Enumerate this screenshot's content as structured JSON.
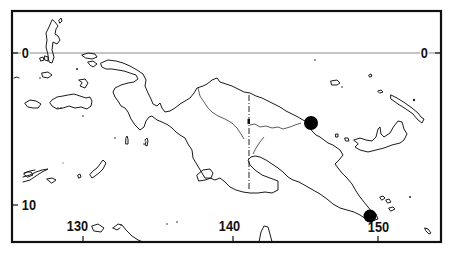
{
  "map": {
    "title": "",
    "frame": {
      "x": 12,
      "y": 11,
      "width": 429,
      "height": 231
    },
    "graticule": {
      "latitude_labels": [
        {
          "text": "0",
          "side": "left",
          "x": 22,
          "y": 46
        },
        {
          "text": "0",
          "side": "right",
          "x": 421,
          "y": 46
        },
        {
          "text": "10",
          "side": "left",
          "x": 20,
          "y": 198
        }
      ],
      "longitude_labels": [
        {
          "text": "130",
          "x": 67,
          "y": 219
        },
        {
          "text": "140",
          "x": 218,
          "y": 219
        },
        {
          "text": "150",
          "x": 365,
          "y": 220
        }
      ],
      "equator_y": 53,
      "lon_ticks_x": [
        83,
        233,
        378
      ],
      "lat_ticks_y": [
        53,
        205
      ]
    },
    "sites": [
      {
        "name": "site-north-coast",
        "cx": 311,
        "cy": 123,
        "r": 7
      },
      {
        "name": "site-southeast-tip",
        "cx": 370,
        "cy": 216,
        "r": 6.5
      }
    ],
    "regions": {
      "main_island": "New Guinea",
      "international_border_longitude": 141
    }
  }
}
